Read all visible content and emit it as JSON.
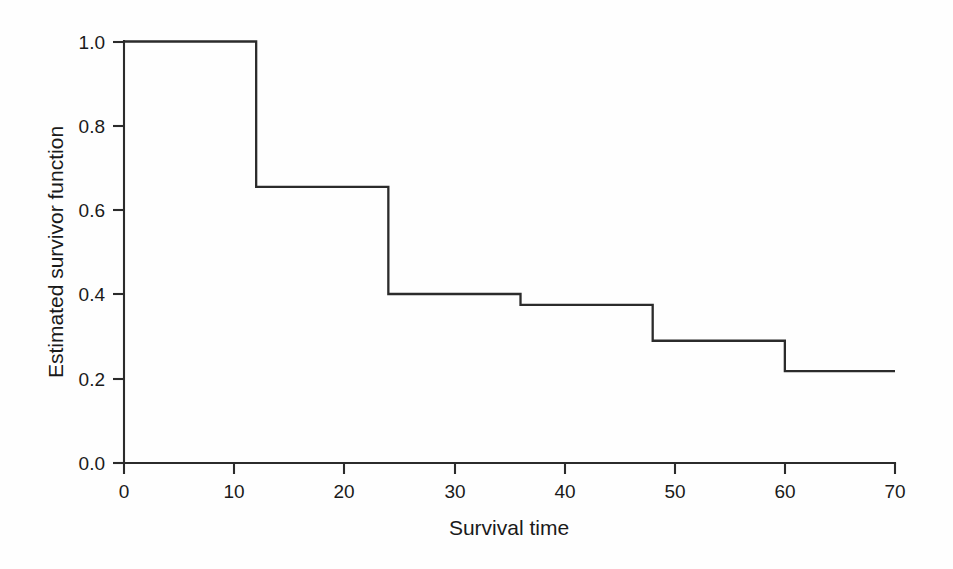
{
  "chart_data": {
    "type": "line",
    "subtype": "step-post",
    "title": "",
    "xlabel": "Survival time",
    "ylabel": "Estimated survivor function",
    "xlim": [
      0,
      70
    ],
    "ylim": [
      0.0,
      1.0
    ],
    "xticks": [
      0,
      10,
      20,
      30,
      40,
      50,
      60,
      70
    ],
    "xtick_labels": [
      "0",
      "10",
      "20",
      "30",
      "40",
      "50",
      "60",
      "70"
    ],
    "yticks": [
      0.0,
      0.2,
      0.4,
      0.6,
      0.8,
      1.0
    ],
    "ytick_labels": [
      "0.0",
      "0.2",
      "0.4",
      "0.6",
      "0.8",
      "1.0"
    ],
    "grid": false,
    "legend": false,
    "line_color": "#2b2b2b",
    "background_color": "#fefefe",
    "series": [
      {
        "name": "Estimated survivor function",
        "x": [
          0,
          12,
          12,
          24,
          24,
          36,
          36,
          48,
          48,
          60,
          60,
          70
        ],
        "y": [
          1.0,
          1.0,
          0.655,
          0.655,
          0.401,
          0.401,
          0.375,
          0.375,
          0.29,
          0.29,
          0.218,
          0.218
        ]
      }
    ],
    "step_points": [
      {
        "time": 0,
        "survival": 1.0
      },
      {
        "time": 12,
        "survival": 0.655
      },
      {
        "time": 24,
        "survival": 0.401
      },
      {
        "time": 36,
        "survival": 0.375
      },
      {
        "time": 48,
        "survival": 0.29
      },
      {
        "time": 60,
        "survival": 0.218
      },
      {
        "time": 70,
        "survival": 0.218
      }
    ]
  }
}
